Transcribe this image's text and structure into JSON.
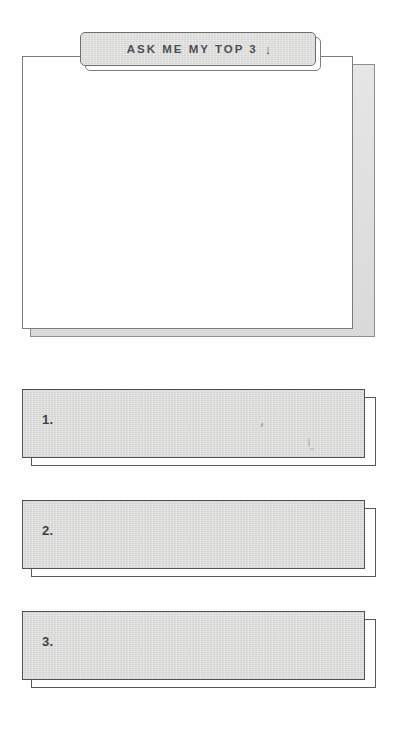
{
  "page": {
    "background_color": "#fefefe",
    "ink_color": "#4a4f55",
    "card_fill": "#dadad8",
    "card_border": "#4f5357",
    "sheet_fill": "#ffffff"
  },
  "prompt_card": {
    "tab": {
      "text": "ASK ME MY TOP 3",
      "arrow_glyph": "↓",
      "arrow_name": "arrow-down-icon"
    },
    "writing_area": {
      "content": "",
      "placeholder": ""
    }
  },
  "answers": {
    "rows": [
      {
        "number": "1.",
        "value": ""
      },
      {
        "number": "2.",
        "value": ""
      },
      {
        "number": "3.",
        "value": ""
      }
    ]
  }
}
